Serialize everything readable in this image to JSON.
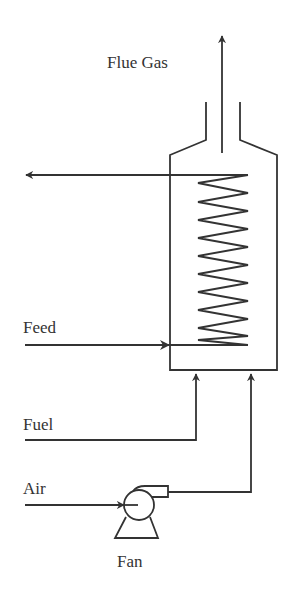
{
  "diagram": {
    "labels": {
      "flue_gas": "Flue Gas",
      "feed": "Feed",
      "fuel": "Fuel",
      "air": "Air",
      "fan": "Fan"
    },
    "colors": {
      "line": "#333333",
      "background": "#ffffff"
    },
    "components": [
      "furnace-vessel",
      "heating-coil",
      "stack",
      "fan"
    ],
    "streams": [
      {
        "name": "Flue Gas",
        "direction": "up, out of stack"
      },
      {
        "name": "Product outlet",
        "direction": "left, from top of coil"
      },
      {
        "name": "Feed",
        "direction": "right, into bottom of coil"
      },
      {
        "name": "Fuel",
        "direction": "up, into furnace bottom"
      },
      {
        "name": "Air",
        "direction": "through fan, up into furnace bottom"
      }
    ]
  }
}
